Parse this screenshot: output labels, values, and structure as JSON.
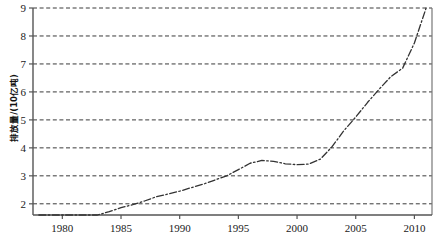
{
  "chart_data": {
    "type": "line",
    "title": "",
    "xlabel": "",
    "ylabel": "排放量/(10亿吨)",
    "xlim": [
      1977.5,
      2011.5
    ],
    "ylim": [
      1.6,
      9.0
    ],
    "xticks": [
      1980,
      1985,
      1990,
      1995,
      2000,
      2005,
      2010
    ],
    "yticks": [
      2,
      3,
      4,
      5,
      6,
      7,
      8,
      9
    ],
    "grid": "horizontal-dashed",
    "legend": "none",
    "line_style": "dash-dot",
    "line_color": "#333333",
    "series": [
      {
        "name": "排放量",
        "x": [
          1978,
          1979,
          1980,
          1981,
          1982,
          1983,
          1984,
          1985,
          1986,
          1987,
          1988,
          1989,
          1990,
          1991,
          1992,
          1993,
          1994,
          1995,
          1996,
          1997,
          1998,
          1999,
          2000,
          2001,
          2002,
          2003,
          2004,
          2005,
          2006,
          2007,
          2008,
          2009,
          2010,
          2011
        ],
        "values": [
          1.45,
          1.47,
          1.48,
          1.47,
          1.52,
          1.6,
          1.72,
          1.86,
          1.97,
          2.1,
          2.25,
          2.35,
          2.45,
          2.58,
          2.7,
          2.85,
          3.0,
          3.22,
          3.45,
          3.55,
          3.52,
          3.43,
          3.4,
          3.42,
          3.6,
          4.05,
          4.62,
          5.1,
          5.62,
          6.1,
          6.55,
          6.85,
          7.75,
          9.0
        ]
      }
    ]
  },
  "axis": {
    "y_tick_labels": [
      "9",
      "8",
      "7",
      "6",
      "5",
      "4",
      "3",
      "2"
    ],
    "x_tick_labels": [
      "1980",
      "1985",
      "1990",
      "1995",
      "2000",
      "2005",
      "2010"
    ]
  }
}
